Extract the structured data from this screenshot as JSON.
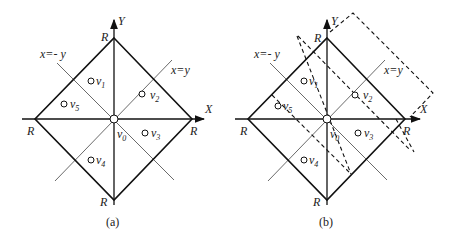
{
  "panels": [
    {
      "caption": "(a)",
      "axis_x": "X",
      "axis_y": "Y",
      "line_neg": "x=- y",
      "line_pos": "x=y",
      "vertex_label": "R",
      "points": [
        {
          "name": "v",
          "sub": "0"
        },
        {
          "name": "v",
          "sub": "1"
        },
        {
          "name": "v",
          "sub": "2"
        },
        {
          "name": "v",
          "sub": "3"
        },
        {
          "name": "v",
          "sub": "4"
        },
        {
          "name": "v",
          "sub": "5"
        }
      ]
    },
    {
      "caption": "(b)",
      "axis_x": "X",
      "axis_y": "Y",
      "line_neg": "x=- y",
      "line_pos": "x=y",
      "vertex_label": "R",
      "points": [
        {
          "name": "v",
          "sub": "0"
        },
        {
          "name": "v",
          "sub": "1"
        },
        {
          "name": "v",
          "sub": "2"
        },
        {
          "name": "v",
          "sub": "3"
        },
        {
          "name": "v",
          "sub": "4"
        },
        {
          "name": "v",
          "sub": "5"
        }
      ]
    }
  ]
}
